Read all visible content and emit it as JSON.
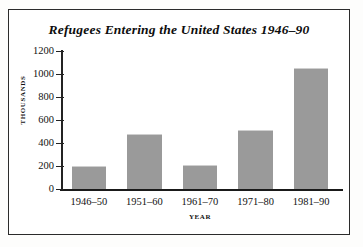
{
  "chart_data": {
    "type": "bar",
    "title": "Refugees Entering the United States 1946–90",
    "xlabel": "YEAR",
    "ylabel": "THOUSANDS",
    "categories": [
      "1946–50",
      "1951–60",
      "1961–70",
      "1971–80",
      "1981–90"
    ],
    "values": [
      200,
      475,
      210,
      515,
      1050
    ],
    "ylim": [
      0,
      1200
    ],
    "ytick_values": [
      0,
      200,
      400,
      600,
      800,
      1000,
      1200
    ],
    "ytick_labels": [
      "0",
      "200",
      "400",
      "600",
      "800",
      "1000",
      "1200"
    ],
    "grid": false,
    "legend": "none",
    "bar_color": "#9a9a9a",
    "axis_color": "#232323",
    "background_color": "#ffffff",
    "frame_color": "#2b2b2b"
  }
}
